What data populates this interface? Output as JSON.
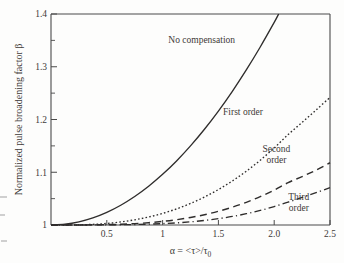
{
  "figure": {
    "background_color": "#fdfdfc",
    "ink_color": "#2f2d2c"
  },
  "chart_data": {
    "type": "line",
    "title": "",
    "subtitle": "",
    "xlabel": "α = <τ>/τ₀",
    "ylabel": "Normalized pulse broadening factor β",
    "xlim": [
      0,
      2.5
    ],
    "ylim": [
      1.0,
      1.4
    ],
    "grid": false,
    "legend_position": "inline-annotations",
    "x_ticks": [
      0.5,
      1,
      1.5,
      2.0,
      2.5
    ],
    "x_tick_labels": [
      "0.5",
      "1",
      "1.5",
      "2.0",
      "2.5"
    ],
    "y_ticks": [
      1,
      1.1,
      1.2,
      1.3,
      1.4
    ],
    "y_tick_labels": [
      "1",
      "1.1",
      "1.2",
      "1.3",
      "1.4"
    ],
    "y_minor_ticks": [
      1.05,
      1.15,
      1.25,
      1.35
    ],
    "x": [
      0,
      0.125,
      0.25,
      0.375,
      0.5,
      0.625,
      0.75,
      0.875,
      1.0,
      1.125,
      1.25,
      1.375,
      1.5,
      1.625,
      1.75,
      1.875,
      2.0,
      2.125,
      2.25,
      2.375,
      2.5
    ],
    "series": [
      {
        "name": "No compensation",
        "style": "solid",
        "label": "No compensation",
        "label_x": 1.35,
        "label_y": 1.345,
        "values": [
          1.0,
          1.0015,
          1.006,
          1.0135,
          1.024,
          1.0375,
          1.054,
          1.0735,
          1.096,
          1.1215,
          1.15,
          1.1815,
          1.216,
          1.2535,
          1.294,
          1.3375,
          1.384,
          1.434,
          1.486,
          1.542,
          1.6
        ]
      },
      {
        "name": "First order",
        "style": "dotted",
        "label": "First order",
        "label_x": 1.72,
        "label_y": 1.208,
        "values": [
          1.0,
          1.0001,
          1.0004,
          1.0012,
          1.003,
          1.0058,
          1.0098,
          1.0152,
          1.022,
          1.0305,
          1.0408,
          1.053,
          1.0672,
          1.0835,
          1.102,
          1.1228,
          1.146,
          1.1715,
          1.1945,
          1.218,
          1.242
        ]
      },
      {
        "name": "Second order",
        "style": "dashed",
        "label": "Second order",
        "label_line1": "Second",
        "label_line2": "order",
        "label_x": 2.02,
        "label_y": 1.138,
        "values": [
          1.0,
          1.0,
          1.0001,
          1.0003,
          1.0007,
          1.0014,
          1.0026,
          1.0044,
          1.0068,
          1.01,
          1.0142,
          1.0195,
          1.026,
          1.0338,
          1.043,
          1.0538,
          1.0662,
          1.0804,
          1.0918,
          1.104,
          1.118
        ]
      },
      {
        "name": "Third order",
        "style": "dash-dot",
        "label": "Third order",
        "label_line1": "Third",
        "label_line2": "order",
        "label_x": 2.22,
        "label_y": 1.047,
        "values": [
          1.0,
          1.0,
          1.0,
          1.0001,
          1.0002,
          1.0005,
          1.0009,
          1.0016,
          1.0026,
          1.004,
          1.006,
          1.0086,
          1.012,
          1.0162,
          1.0214,
          1.0276,
          1.035,
          1.0434,
          1.0522,
          1.0612,
          1.071
        ]
      }
    ]
  }
}
